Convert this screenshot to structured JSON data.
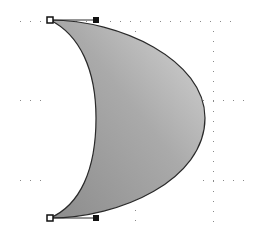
{
  "canvas": {
    "width": 257,
    "height": 235,
    "background": "#ffffff",
    "grid_dot_color": "#8a8a8a"
  },
  "shape": {
    "type": "crescent",
    "fill_gradient": {
      "from": "#8f8f8f",
      "to": "#d4d4d4"
    },
    "stroke": "#2a2a2a",
    "top_point": [
      50,
      20
    ],
    "bottom_point": [
      50,
      218
    ],
    "outer_extent_x": 205,
    "inner_extent_x": 96
  },
  "handles": [
    {
      "id": "anchor-top",
      "x": 50,
      "y": 20,
      "style": "hollow"
    },
    {
      "id": "control-top",
      "x": 96,
      "y": 20,
      "style": "filled"
    },
    {
      "id": "anchor-bottom",
      "x": 50,
      "y": 218,
      "style": "hollow"
    },
    {
      "id": "control-bottom",
      "x": 96,
      "y": 218,
      "style": "filled"
    }
  ]
}
